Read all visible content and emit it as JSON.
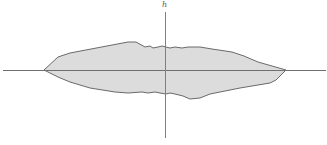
{
  "diagram": {
    "axis_label_vertical": "h",
    "colors": {
      "fill": "#dcdcdc",
      "outline": "#6a6a6a",
      "axis": "#707070",
      "background": "#ffffff"
    },
    "shape": "irregular lens-shaped region symmetric-ish about horizontal axis"
  }
}
